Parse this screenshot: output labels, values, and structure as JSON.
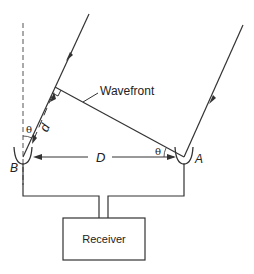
{
  "diagram": {
    "type": "radio interferometer geometry",
    "labels": {
      "wavefront": "Wavefront",
      "antenna_a": "A",
      "antenna_b": "B",
      "baseline": "D",
      "path_difference": "d",
      "angle_b": "θ",
      "angle_a": "θ",
      "receiver": "Receiver"
    },
    "colors": {
      "line": "#333333",
      "background": "#ffffff"
    }
  }
}
